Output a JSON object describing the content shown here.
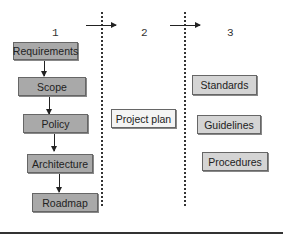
{
  "columns": [
    {
      "number": "1"
    },
    {
      "number": "2"
    },
    {
      "number": "3"
    }
  ],
  "column1": {
    "boxes": [
      "Requirements",
      "Scope",
      "Policy",
      "Architecture",
      "Roadmap"
    ]
  },
  "column2": {
    "boxes": [
      "Project plan"
    ]
  },
  "column3": {
    "boxes": [
      "Standards",
      "Guidelines",
      "Procedures"
    ]
  },
  "colors": {
    "dark_box": "#a9a9a9",
    "light_box": "#d4d4d4",
    "white_box": "#f4f4f4",
    "line": "#222222"
  }
}
